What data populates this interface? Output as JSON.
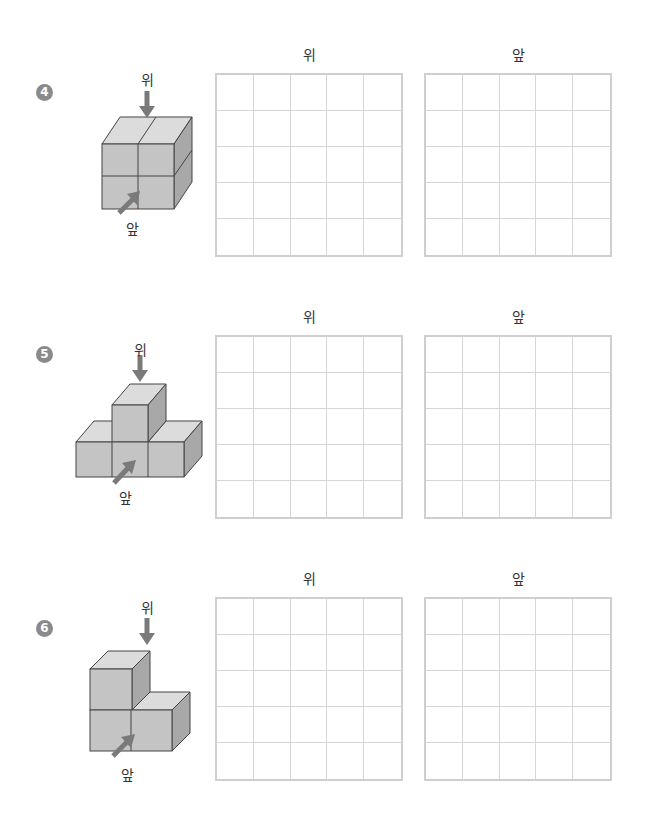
{
  "labels": {
    "top": "위",
    "front": "앞"
  },
  "problems": [
    {
      "number": "4",
      "grid_titles": [
        "위",
        "앞"
      ],
      "grid_size": 5,
      "shape": "2x2 cube stack"
    },
    {
      "number": "5",
      "grid_titles": [
        "위",
        "앞"
      ],
      "grid_size": 5,
      "shape": "T-shaped pyramid (3 bottom, 1 top)"
    },
    {
      "number": "6",
      "grid_titles": [
        "위",
        "앞"
      ],
      "grid_size": 5,
      "shape": "L-shaped (2 bottom, 1 top-left)"
    }
  ],
  "colors": {
    "cube_front": "#c4c4c4",
    "cube_top": "#dcdcdc",
    "cube_side": "#a8a8a8",
    "arrow": "#7a7a7a",
    "grid_line": "#d0d0d0",
    "badge": "#8a8a8a"
  }
}
